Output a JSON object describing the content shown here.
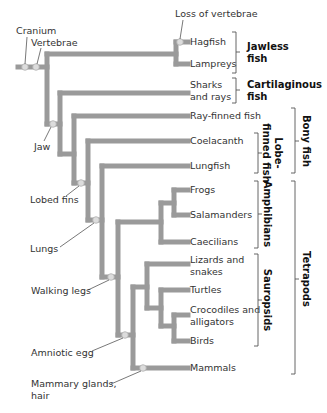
{
  "diagram": {
    "type": "cladogram",
    "colors": {
      "branch": "#9a9a9a",
      "node": "#dcdcdc",
      "text": "#333333"
    },
    "characters": [
      {
        "id": "cranium",
        "label": "Cranium"
      },
      {
        "id": "vertebrae",
        "label": "Vertebrae"
      },
      {
        "id": "loss_vertebrae",
        "label": "Loss of vertebrae"
      },
      {
        "id": "jaw",
        "label": "Jaw"
      },
      {
        "id": "lobed_fins",
        "label": "Lobed fins"
      },
      {
        "id": "lungs",
        "label": "Lungs"
      },
      {
        "id": "walking_legs",
        "label": "Walking legs"
      },
      {
        "id": "amniotic_egg",
        "label": "Amniotic egg"
      },
      {
        "id": "mammary",
        "label_line1": "Mammary glands,",
        "label_line2": "hair"
      }
    ],
    "taxa": [
      {
        "id": "hagfish",
        "label": "Hagfish"
      },
      {
        "id": "lampreys",
        "label": "Lampreys"
      },
      {
        "id": "sharks",
        "label_line1": "Sharks",
        "label_line2": "and rays"
      },
      {
        "id": "rayfinned",
        "label": "Ray-finned fish"
      },
      {
        "id": "coelacanth",
        "label": "Coelacanth"
      },
      {
        "id": "lungfish",
        "label": "Lungfish"
      },
      {
        "id": "frogs",
        "label": "Frogs"
      },
      {
        "id": "salamanders",
        "label": "Salamanders"
      },
      {
        "id": "caecilians",
        "label": "Caecilians"
      },
      {
        "id": "lizards",
        "label_line1": "Lizards and",
        "label_line2": "snakes"
      },
      {
        "id": "turtles",
        "label": "Turtles"
      },
      {
        "id": "crocodiles",
        "label_line1": "Crocodiles and",
        "label_line2": "alligators"
      },
      {
        "id": "birds",
        "label": "Birds"
      },
      {
        "id": "mammals",
        "label": "Mammals"
      }
    ],
    "groups": {
      "jawless": {
        "line1": "Jawless",
        "line2": "fish"
      },
      "cartilaginous": {
        "line1": "Cartilaginous",
        "line2": "fish"
      },
      "bony": {
        "label": "Bony fish"
      },
      "lobefinned": {
        "line1": "Lobe-",
        "line2": "finned fish"
      },
      "amphibians": {
        "label": "Amphibians"
      },
      "sauropsids": {
        "label": "Sauropsids"
      },
      "tetrapods": {
        "label": "Tetrapods"
      }
    }
  }
}
